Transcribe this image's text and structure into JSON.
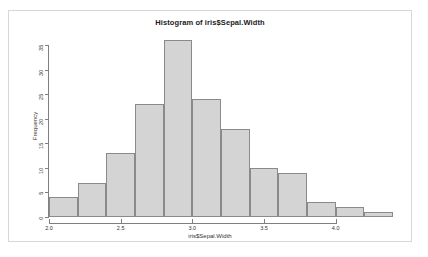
{
  "chart_data": {
    "type": "bar",
    "title": "Histogram of iris$Sepal.Width",
    "xlabel": "iris$Sepal.Width",
    "ylabel": "Frequency",
    "bin_width": 0.2,
    "bin_edges": [
      2.0,
      2.2,
      2.4,
      2.6,
      2.8,
      3.0,
      3.2,
      3.4,
      3.6,
      3.8,
      4.0,
      4.2,
      4.4
    ],
    "categories": [
      "2.0-2.2",
      "2.2-2.4",
      "2.4-2.6",
      "2.6-2.8",
      "2.8-3.0",
      "3.0-3.2",
      "3.2-3.4",
      "3.4-3.6",
      "3.6-3.8",
      "3.8-4.0",
      "4.0-4.2",
      "4.2-4.4"
    ],
    "values": [
      4,
      7,
      13,
      23,
      36,
      24,
      18,
      10,
      9,
      3,
      2,
      1
    ],
    "xlim": [
      2.0,
      4.4
    ],
    "ylim": [
      0,
      35
    ],
    "xticks": [
      2.0,
      2.5,
      3.0,
      3.5,
      4.0
    ],
    "xtick_labels": [
      "2.0",
      "2.5",
      "3.0",
      "3.5",
      "4.0"
    ],
    "yticks": [
      0,
      5,
      10,
      15,
      20,
      25,
      30,
      35
    ],
    "ytick_labels": [
      "0",
      "5",
      "10",
      "15",
      "20",
      "25",
      "30",
      "35"
    ],
    "grid": false,
    "legend": null,
    "bar_fill_color": "#d4d4d4",
    "bar_border_color": "#8a8a8a",
    "axis_color": "#808080",
    "background_color": "#ffffff",
    "frame_border_color": "#d8d8d8"
  }
}
